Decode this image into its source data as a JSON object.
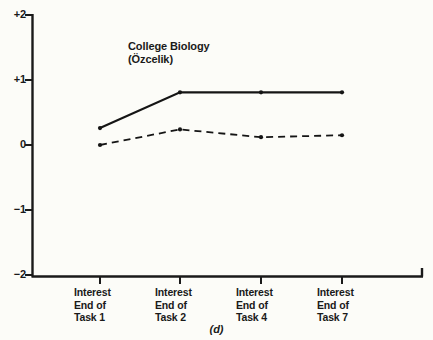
{
  "chart_data": {
    "type": "line",
    "title": "College Biology",
    "subtitle": "(Özcelik)",
    "caption": "(d)",
    "xlabel": "",
    "ylabel": "",
    "categories": [
      "Interest End of Task 1",
      "Interest End of Task 2",
      "Interest End of Task 4",
      "Interest End of Task 7"
    ],
    "category_lines": [
      [
        "Interest",
        "End of",
        "Task 1"
      ],
      [
        "Interest",
        "End of",
        "Task 2"
      ],
      [
        "Interest",
        "End of",
        "Task 4"
      ],
      [
        "Interest",
        "End of",
        "Task 7"
      ]
    ],
    "ylim": [
      -2,
      2
    ],
    "yticks": [
      2,
      1,
      0,
      -1,
      -2
    ],
    "ytick_labels": [
      "+2",
      "+1",
      "0",
      "−1",
      "−2"
    ],
    "grid": false,
    "legend": "none",
    "series": [
      {
        "name": "solid",
        "style": "solid",
        "color": "#151515",
        "values": [
          0.26,
          0.81,
          0.81,
          0.81
        ]
      },
      {
        "name": "dashed",
        "style": "dashed",
        "color": "#151515",
        "values": [
          0.0,
          0.24,
          0.12,
          0.15
        ]
      }
    ]
  },
  "axes": {
    "line_color": "#1a1a1a",
    "background": "#fcfcf8"
  }
}
